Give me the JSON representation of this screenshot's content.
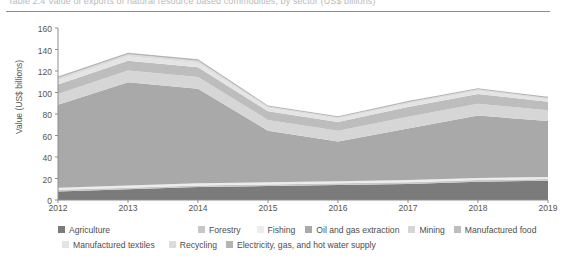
{
  "title": {
    "text": "Table 2.4  Value of exports of natural resource based commodities, by sector (US$ billions)"
  },
  "axes": {
    "y_label": "Value (US$ billions)",
    "y_ticks": [
      "160",
      "140",
      "120",
      "100",
      "80",
      "60",
      "40",
      "20",
      "0"
    ],
    "x_ticks": [
      "2012",
      "2013",
      "2014",
      "2015",
      "2016",
      "2017",
      "2018",
      "2019"
    ]
  },
  "legend": {
    "row1": [
      {
        "label": "Agriculture",
        "color": "#7b7b7b"
      },
      {
        "label": "Forestry",
        "color": "#c7c7c7"
      },
      {
        "label": "Fishing",
        "color": "#ececec"
      },
      {
        "label": "Oil and gas extraction",
        "color": "#a9a9a9"
      },
      {
        "label": "Mining",
        "color": "#d6d6d6"
      },
      {
        "label": "Manufactured food",
        "color": "#bdbdbd"
      }
    ],
    "row2": [
      {
        "label": "Manufactured textiles",
        "color": "#e4e4e4"
      },
      {
        "label": "Recycling",
        "color": "#dcdcdc"
      },
      {
        "label": "Electricity, gas, and hot water supply",
        "color": "#b4b4b4"
      }
    ]
  },
  "chart_data": {
    "type": "area",
    "title": "Value of exports of natural resource based commodities, by sector (US$ billions)",
    "xlabel": "",
    "ylabel": "Value (US$ billions)",
    "ylim": [
      0,
      160
    ],
    "grid": false,
    "legend_position": "bottom",
    "stacked": true,
    "x": [
      2012,
      2013,
      2014,
      2015,
      2016,
      2017,
      2018,
      2019
    ],
    "categories": [
      "2012",
      "2013",
      "2014",
      "2015",
      "2016",
      "2017",
      "2018",
      "2019"
    ],
    "series": [
      {
        "name": "Agriculture",
        "color": "#7b7b7b",
        "values": [
          8,
          10,
          12,
          13,
          14,
          15,
          17,
          18
        ]
      },
      {
        "name": "Forestry",
        "color": "#c7c7c7",
        "values": [
          1.5,
          1.5,
          1.5,
          1.5,
          1.5,
          1.5,
          1.5,
          1.5
        ]
      },
      {
        "name": "Fishing",
        "color": "#ececec",
        "values": [
          2,
          2,
          2,
          2,
          2,
          2,
          2,
          2
        ]
      },
      {
        "name": "Oil and gas extraction",
        "color": "#a9a9a9",
        "values": [
          77,
          96,
          88,
          48,
          37,
          48,
          58,
          52
        ]
      },
      {
        "name": "Mining",
        "color": "#d6d6d6",
        "values": [
          10,
          11,
          11,
          10,
          10,
          11,
          11,
          10
        ]
      },
      {
        "name": "Manufactured food",
        "color": "#bdbdbd",
        "values": [
          9,
          9,
          9,
          8,
          8,
          9,
          9,
          8
        ]
      },
      {
        "name": "Manufactured textiles",
        "color": "#e4e4e4",
        "values": [
          4,
          4,
          4,
          3,
          3,
          3,
          3,
          2
        ]
      },
      {
        "name": "Recycling",
        "color": "#dcdcdc",
        "values": [
          2,
          2,
          2,
          1.5,
          1.5,
          1.5,
          1.5,
          1.5
        ]
      },
      {
        "name": "Electricity, gas, and hot water supply",
        "color": "#b4b4b4",
        "values": [
          1.5,
          1.5,
          1.5,
          1,
          1,
          1,
          1,
          1
        ]
      }
    ],
    "totals": [
      115,
      137,
      131,
      88,
      78,
      92,
      104,
      96
    ]
  }
}
